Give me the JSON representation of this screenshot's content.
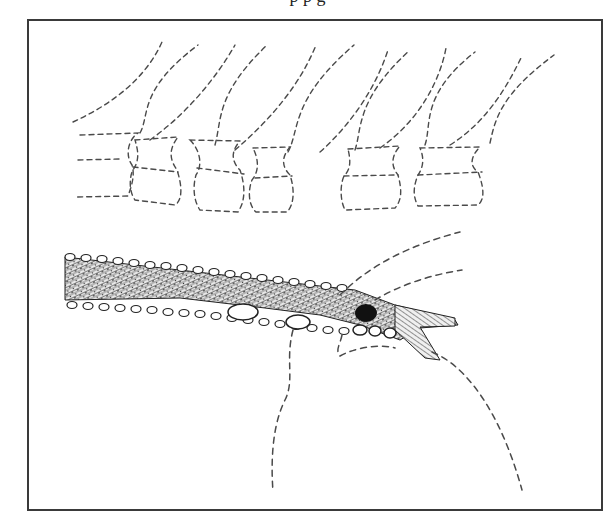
{
  "figure": {
    "caption_fragment": "p                          p                                   g",
    "frame_color": "#3a3a3a",
    "background": "#ffffff"
  },
  "elements": {
    "vertebrae": {
      "count": 6,
      "style": "dashed-outline"
    },
    "spinous_processes": {
      "count": 12,
      "style": "dashed-curves"
    },
    "cord_band": {
      "fill": "stippled",
      "border_dots": "oval-beads"
    },
    "cysts": {
      "count": 3,
      "color": "#ffffff"
    },
    "dark_lesion": {
      "color": "#111111"
    },
    "nerve_root": {
      "style": "hatched"
    },
    "lower_mass": {
      "style": "dashed-outline"
    }
  }
}
